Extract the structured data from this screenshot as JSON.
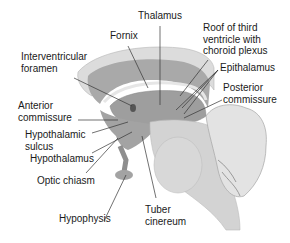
{
  "diagram": {
    "colors": {
      "outer_cortex": "#d9d9d9",
      "inner_band": "#a8a8a8",
      "thalamus": "#9c9c9c",
      "brainstem": "#d4d4d4",
      "ventricle": "#c0c0c0",
      "leader_line": "#333333",
      "label_text": "#1a1a1a"
    },
    "labels": {
      "thalamus": "Thalamus",
      "fornix": "Fornix",
      "roof": "Roof of third\nventricle with\nchoroid plexus",
      "interventricular": "Interventricular\nforamen",
      "epithalamus": "Epithalamus",
      "anterior_commissure": "Anterior\ncommissure",
      "posterior_commissure": "Posterior\ncommissure",
      "hypothalamic_sulcus": "Hypothalamic\nsulcus",
      "hypothalamus": "Hypothalamus",
      "optic_chiasm": "Optic chiasm",
      "tuber_cinereum": "Tuber\ncinereum",
      "hypophysis": "Hypophysis"
    }
  }
}
